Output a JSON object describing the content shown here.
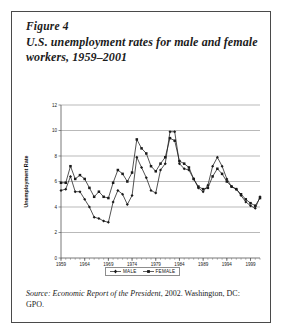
{
  "figure": {
    "number_label": "Figure 4",
    "title": "U.S. unemployment rates for male and female workers, 1959–2001"
  },
  "source": {
    "lead": "Source:",
    "work": " Economic Report of the President",
    "rest": ", 2002. Washington, DC: GPO."
  },
  "legend": {
    "items": [
      {
        "label": "MALE",
        "color": "#1a1a1a",
        "marker": "diamond"
      },
      {
        "label": "FEMALE",
        "color": "#1a1a1a",
        "marker": "square"
      }
    ]
  },
  "chart_data": {
    "type": "line",
    "title": "",
    "xlabel": "Year",
    "ylabel": "Unemployment Rate",
    "grid": true,
    "legend_position": "bottom",
    "xlim": [
      1959,
      2001
    ],
    "ylim": [
      0,
      12
    ],
    "yticks": [
      0,
      2,
      4,
      6,
      8,
      10,
      12
    ],
    "xticks": [
      1959,
      1964,
      1969,
      1974,
      1979,
      1984,
      1989,
      1994,
      1999
    ],
    "x": [
      1959,
      1960,
      1961,
      1962,
      1963,
      1964,
      1965,
      1966,
      1967,
      1968,
      1969,
      1970,
      1971,
      1972,
      1973,
      1974,
      1975,
      1976,
      1977,
      1978,
      1979,
      1980,
      1981,
      1982,
      1983,
      1984,
      1985,
      1986,
      1987,
      1988,
      1989,
      1990,
      1991,
      1992,
      1993,
      1994,
      1995,
      1996,
      1997,
      1998,
      1999,
      2000,
      2001
    ],
    "series": [
      {
        "name": "MALE",
        "color": "#1a1a1a",
        "marker": "diamond",
        "values": [
          5.3,
          5.4,
          6.4,
          5.2,
          5.2,
          4.6,
          4.0,
          3.2,
          3.1,
          2.9,
          2.8,
          4.4,
          5.3,
          5.0,
          4.2,
          4.9,
          7.9,
          7.1,
          6.3,
          5.3,
          5.1,
          6.9,
          7.4,
          9.9,
          9.9,
          7.4,
          7.0,
          6.9,
          6.2,
          5.5,
          5.2,
          5.7,
          7.2,
          7.9,
          7.2,
          6.2,
          5.6,
          5.4,
          4.9,
          4.4,
          4.1,
          3.9,
          4.8
        ]
      },
      {
        "name": "FEMALE",
        "color": "#1a1a1a",
        "marker": "square",
        "values": [
          5.9,
          5.9,
          7.2,
          6.2,
          6.5,
          6.2,
          5.5,
          4.8,
          5.2,
          4.8,
          4.7,
          5.9,
          6.9,
          6.6,
          6.0,
          6.7,
          9.3,
          8.6,
          8.2,
          7.2,
          6.8,
          7.4,
          7.9,
          9.4,
          9.2,
          7.6,
          7.4,
          7.1,
          6.2,
          5.6,
          5.4,
          5.5,
          6.4,
          7.0,
          6.6,
          6.0,
          5.6,
          5.4,
          5.0,
          4.6,
          4.3,
          4.1,
          4.7
        ]
      }
    ]
  }
}
